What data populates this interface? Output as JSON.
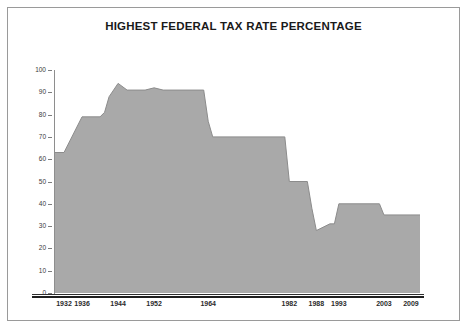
{
  "chart_data": {
    "type": "area",
    "title": "HIGHEST FEDERAL TAX RATE PERCENTAGE",
    "xlabel": "",
    "ylabel": "",
    "ylim": [
      0,
      100
    ],
    "xlim": [
      1930,
      2011
    ],
    "grid": false,
    "legend": "none",
    "fill_color": "#a9a9a9",
    "line_color": "#8a8a8a",
    "y_ticks": [
      0,
      10,
      20,
      30,
      40,
      50,
      60,
      70,
      80,
      90,
      100
    ],
    "y_tick_labels": [
      "0",
      "10",
      "20",
      "30",
      "40",
      "50",
      "60",
      "70",
      "80",
      "90",
      "100"
    ],
    "x_tick_labels": [
      "1932",
      "1936",
      "1944",
      "1952",
      "1964",
      "1982",
      "1988",
      "1993",
      "2003",
      "2009"
    ],
    "x_tick_values": [
      1932,
      1936,
      1944,
      1952,
      1964,
      1982,
      1988,
      1993,
      2003,
      2009
    ],
    "x": [
      1930,
      1932,
      1936,
      1940,
      1941,
      1942,
      1944,
      1946,
      1950,
      1952,
      1954,
      1963,
      1964,
      1965,
      1981,
      1982,
      1986,
      1987,
      1988,
      1991,
      1992,
      1993,
      2002,
      2003,
      2009,
      2011
    ],
    "values": [
      63,
      63,
      79,
      79,
      81,
      88,
      94,
      91,
      91,
      92,
      91,
      91,
      77,
      70,
      70,
      50,
      50,
      38,
      28,
      31,
      31,
      40,
      40,
      35,
      35,
      35
    ],
    "series": [
      {
        "name": "Highest federal tax rate (%)",
        "points": [
          {
            "year": 1930,
            "rate": 63
          },
          {
            "year": 1932,
            "rate": 63
          },
          {
            "year": 1936,
            "rate": 79
          },
          {
            "year": 1940,
            "rate": 79
          },
          {
            "year": 1941,
            "rate": 81
          },
          {
            "year": 1942,
            "rate": 88
          },
          {
            "year": 1944,
            "rate": 94
          },
          {
            "year": 1946,
            "rate": 91
          },
          {
            "year": 1950,
            "rate": 91
          },
          {
            "year": 1952,
            "rate": 92
          },
          {
            "year": 1954,
            "rate": 91
          },
          {
            "year": 1963,
            "rate": 91
          },
          {
            "year": 1964,
            "rate": 77
          },
          {
            "year": 1965,
            "rate": 70
          },
          {
            "year": 1981,
            "rate": 70
          },
          {
            "year": 1982,
            "rate": 50
          },
          {
            "year": 1986,
            "rate": 50
          },
          {
            "year": 1987,
            "rate": 38
          },
          {
            "year": 1988,
            "rate": 28
          },
          {
            "year": 1991,
            "rate": 31
          },
          {
            "year": 1992,
            "rate": 31
          },
          {
            "year": 1993,
            "rate": 40
          },
          {
            "year": 2002,
            "rate": 40
          },
          {
            "year": 2003,
            "rate": 35
          },
          {
            "year": 2009,
            "rate": 35
          },
          {
            "year": 2011,
            "rate": 35
          }
        ]
      }
    ]
  }
}
